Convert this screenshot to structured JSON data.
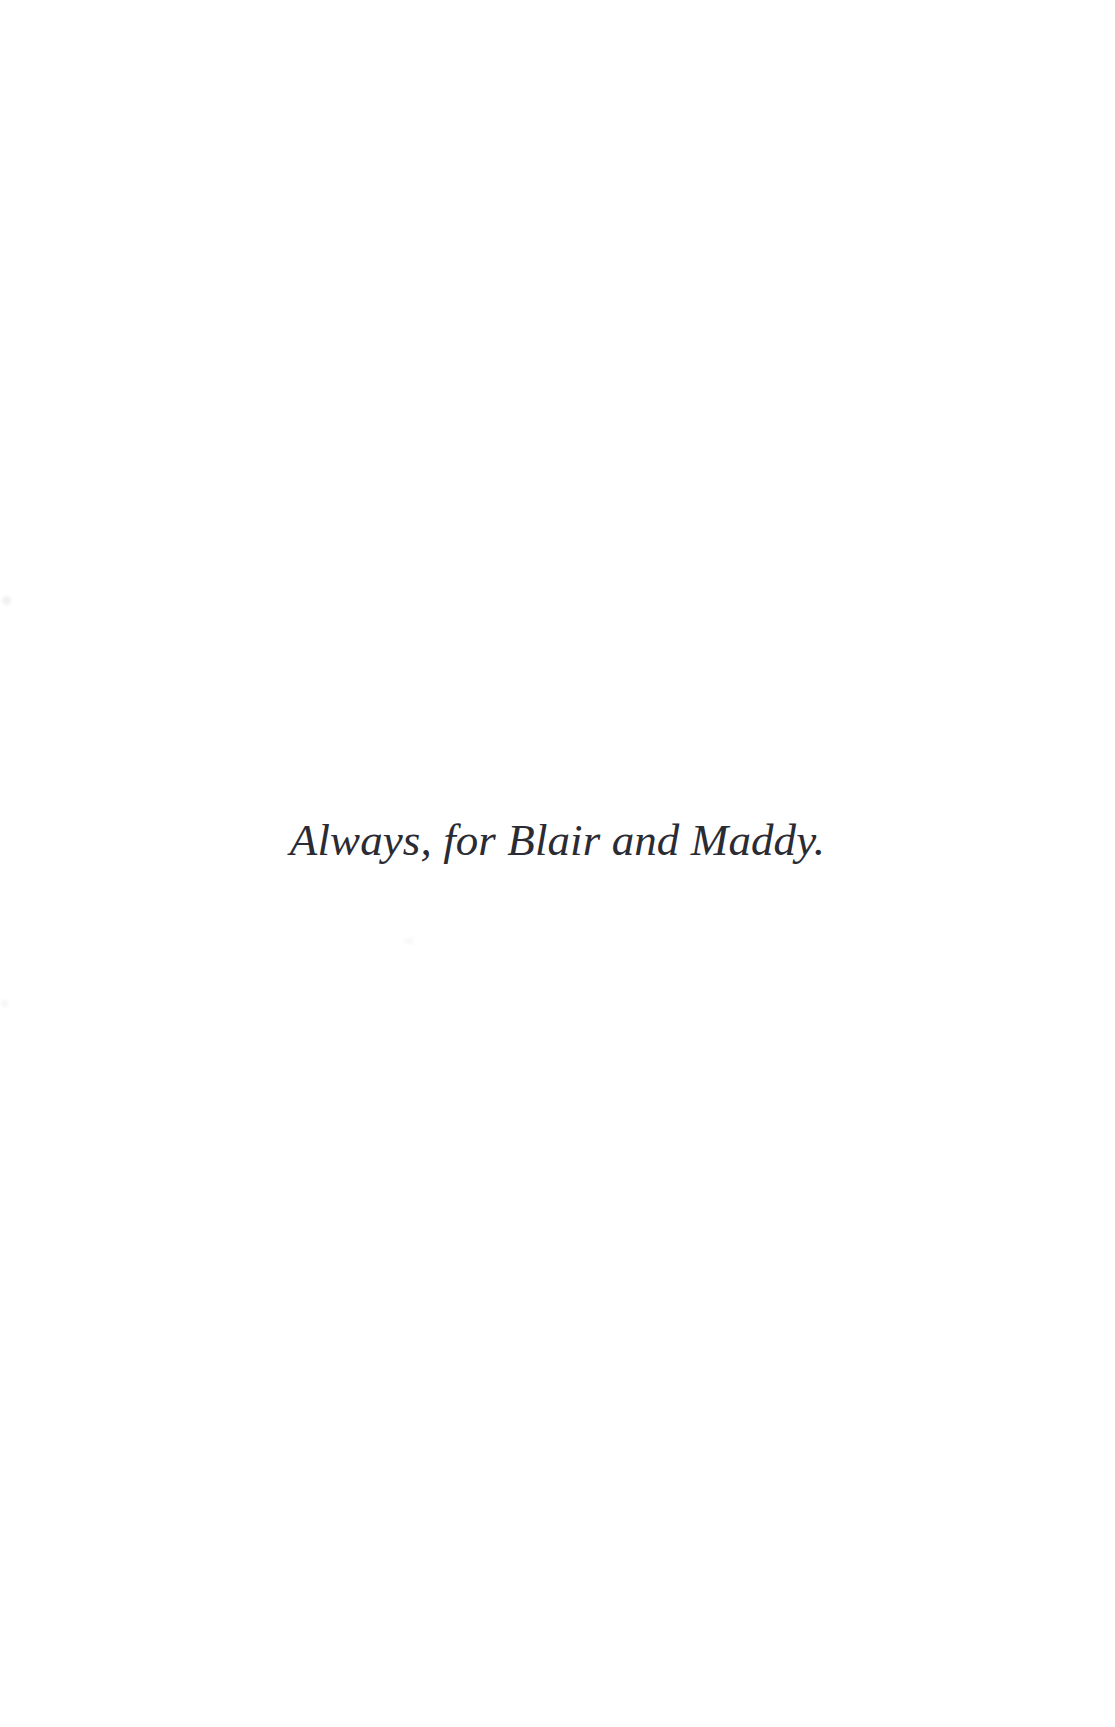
{
  "page": {
    "kind": "book-dedication-page",
    "background_color": "#ffffff",
    "width": 1115,
    "height": 1727
  },
  "dedication": {
    "text": "Always, for Blair and Maddy.",
    "style": "italic",
    "alignment": "center",
    "text_color": "#2b2b33"
  }
}
